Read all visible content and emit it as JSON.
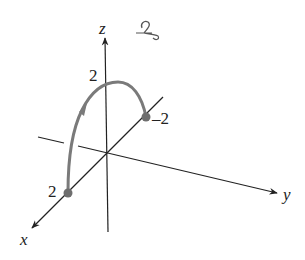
{
  "diagram": {
    "axes": {
      "x_label": "x",
      "y_label": "y",
      "z_label": "z"
    },
    "ticks": {
      "x_tick": "2",
      "z_tick": "2",
      "y_tick": "–2"
    },
    "curve": {
      "description": "semicircular arc from (2,0,0) over (0,0,2) to (0,-2,0)",
      "start_point": "x=2",
      "end_point": "y=-2",
      "color": "#7a7a7a"
    },
    "annotation": "handwritten mark",
    "colors": {
      "axis": "#222222",
      "curve": "#7a7a7a",
      "point": "#6e6e6e"
    }
  }
}
